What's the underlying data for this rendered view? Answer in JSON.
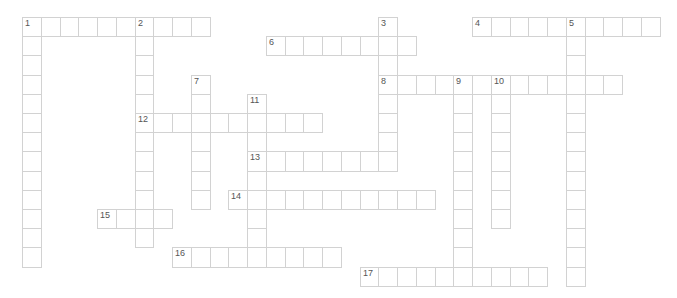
{
  "puzzle": {
    "origin": {
      "x": 22,
      "y": 17
    },
    "cell_width": 18.75,
    "cell_height": 19.2,
    "colors": {
      "border": "#d2d2d2",
      "number": "#555555",
      "background": "#ffffff"
    },
    "entries": [
      {
        "number": "1",
        "direction": "across",
        "row": 0,
        "col": 0,
        "length": 10
      },
      {
        "number": "1",
        "direction": "down",
        "row": 0,
        "col": 0,
        "length": 13
      },
      {
        "number": "2",
        "direction": "down",
        "row": 0,
        "col": 6,
        "length": 12
      },
      {
        "number": "3",
        "direction": "down",
        "row": 0,
        "col": 19,
        "length": 8
      },
      {
        "number": "4",
        "direction": "across",
        "row": 0,
        "col": 24,
        "length": 10
      },
      {
        "number": "5",
        "direction": "down",
        "row": 0,
        "col": 29,
        "length": 14
      },
      {
        "number": "6",
        "direction": "across",
        "row": 1,
        "col": 13,
        "length": 8
      },
      {
        "number": "7",
        "direction": "down",
        "row": 3,
        "col": 9,
        "length": 7
      },
      {
        "number": "8",
        "direction": "across",
        "row": 3,
        "col": 19,
        "length": 13
      },
      {
        "number": "9",
        "direction": "down",
        "row": 3,
        "col": 23,
        "length": 11
      },
      {
        "number": "10",
        "direction": "down",
        "row": 3,
        "col": 25,
        "length": 8
      },
      {
        "number": "11",
        "direction": "down",
        "row": 4,
        "col": 12,
        "length": 9
      },
      {
        "number": "12",
        "direction": "across",
        "row": 5,
        "col": 6,
        "length": 10
      },
      {
        "number": "13",
        "direction": "across",
        "row": 7,
        "col": 12,
        "length": 8
      },
      {
        "number": "14",
        "direction": "across",
        "row": 9,
        "col": 11,
        "length": 11
      },
      {
        "number": "15",
        "direction": "across",
        "row": 10,
        "col": 4,
        "length": 4
      },
      {
        "number": "16",
        "direction": "across",
        "row": 12,
        "col": 8,
        "length": 9
      },
      {
        "number": "17",
        "direction": "across",
        "row": 13,
        "col": 18,
        "length": 10
      }
    ]
  }
}
